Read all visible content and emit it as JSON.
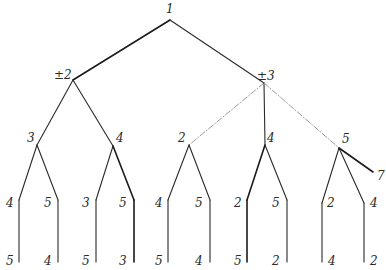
{
  "diagram": {
    "type": "search-tree",
    "nodes": [
      {
        "id": "n1",
        "label": "1",
        "x": 170,
        "y": 20,
        "lx": 166,
        "ly": 13
      },
      {
        "id": "n2",
        "label": "±2",
        "x": 73,
        "y": 80,
        "lx": 54,
        "ly": 79
      },
      {
        "id": "n3",
        "label": "±3",
        "x": 264,
        "y": 83,
        "lx": 257,
        "ly": 80
      },
      {
        "id": "n21",
        "label": "3",
        "x": 37,
        "y": 145,
        "lx": 27,
        "ly": 142
      },
      {
        "id": "n22",
        "label": "4",
        "x": 113,
        "y": 146,
        "lx": 116,
        "ly": 142
      },
      {
        "id": "n31",
        "label": "2",
        "x": 189,
        "y": 145,
        "lx": 178,
        "ly": 142
      },
      {
        "id": "n32",
        "label": "4",
        "x": 265,
        "y": 145,
        "lx": 267,
        "ly": 142
      },
      {
        "id": "n33",
        "label": "5",
        "x": 339,
        "y": 148,
        "lx": 342,
        "ly": 143
      },
      {
        "id": "n211",
        "label": "4",
        "x": 19,
        "y": 200,
        "lx": 6,
        "ly": 207
      },
      {
        "id": "n212",
        "label": "5",
        "x": 58,
        "y": 200,
        "lx": 44,
        "ly": 207
      },
      {
        "id": "n221",
        "label": "3",
        "x": 96,
        "y": 200,
        "lx": 82,
        "ly": 207
      },
      {
        "id": "n222",
        "label": "5",
        "x": 134,
        "y": 200,
        "lx": 119,
        "ly": 207
      },
      {
        "id": "n311",
        "label": "4",
        "x": 168,
        "y": 200,
        "lx": 155,
        "ly": 207
      },
      {
        "id": "n312",
        "label": "5",
        "x": 210,
        "y": 200,
        "lx": 195,
        "ly": 207
      },
      {
        "id": "n321",
        "label": "2",
        "x": 247,
        "y": 200,
        "lx": 234,
        "ly": 207
      },
      {
        "id": "n322",
        "label": "5",
        "x": 287,
        "y": 200,
        "lx": 272,
        "ly": 207
      },
      {
        "id": "n331",
        "label": "2",
        "x": 322,
        "y": 203,
        "lx": 327,
        "ly": 207
      },
      {
        "id": "n332",
        "label": "4",
        "x": 364,
        "y": 203,
        "lx": 370,
        "ly": 207
      },
      {
        "id": "n333",
        "label": "7",
        "x": 373,
        "y": 172,
        "lx": 377,
        "ly": 180
      },
      {
        "id": "n2111",
        "label": "5",
        "x": 19,
        "y": 262,
        "lx": 6,
        "ly": 265
      },
      {
        "id": "n2121",
        "label": "4",
        "x": 58,
        "y": 262,
        "lx": 44,
        "ly": 265
      },
      {
        "id": "n2211",
        "label": "5",
        "x": 96,
        "y": 262,
        "lx": 82,
        "ly": 265
      },
      {
        "id": "n2221",
        "label": "3",
        "x": 134,
        "y": 262,
        "lx": 119,
        "ly": 265
      },
      {
        "id": "n3111",
        "label": "5",
        "x": 168,
        "y": 262,
        "lx": 155,
        "ly": 265
      },
      {
        "id": "n3121",
        "label": "4",
        "x": 210,
        "y": 262,
        "lx": 195,
        "ly": 265
      },
      {
        "id": "n3211",
        "label": "5",
        "x": 247,
        "y": 262,
        "lx": 234,
        "ly": 265
      },
      {
        "id": "n3221",
        "label": "2",
        "x": 287,
        "y": 262,
        "lx": 272,
        "ly": 265
      },
      {
        "id": "n3311",
        "label": "4",
        "x": 322,
        "y": 262,
        "lx": 328,
        "ly": 265
      },
      {
        "id": "n3321",
        "label": "2",
        "x": 364,
        "y": 262,
        "lx": 370,
        "ly": 265
      }
    ],
    "edges": [
      {
        "from": "n1",
        "to": "n2",
        "style": "bold"
      },
      {
        "from": "n1",
        "to": "n3",
        "style": "solid"
      },
      {
        "from": "n2",
        "to": "n21",
        "style": "solid"
      },
      {
        "from": "n2",
        "to": "n22",
        "style": "solid"
      },
      {
        "from": "n3",
        "to": "n31",
        "style": "dashdot"
      },
      {
        "from": "n3",
        "to": "n32",
        "style": "solid"
      },
      {
        "from": "n3",
        "to": "n33",
        "style": "dashdot"
      },
      {
        "from": "n21",
        "to": "n211",
        "style": "solid"
      },
      {
        "from": "n21",
        "to": "n212",
        "style": "solid"
      },
      {
        "from": "n22",
        "to": "n221",
        "style": "solid"
      },
      {
        "from": "n22",
        "to": "n222",
        "style": "bold"
      },
      {
        "from": "n31",
        "to": "n311",
        "style": "solid"
      },
      {
        "from": "n31",
        "to": "n312",
        "style": "solid"
      },
      {
        "from": "n32",
        "to": "n321",
        "style": "bold"
      },
      {
        "from": "n32",
        "to": "n322",
        "style": "solid"
      },
      {
        "from": "n33",
        "to": "n331",
        "style": "solid"
      },
      {
        "from": "n33",
        "to": "n332",
        "style": "solid"
      },
      {
        "from": "n33",
        "to": "n333",
        "style": "bold"
      },
      {
        "from": "n211",
        "to": "n2111",
        "style": "solid"
      },
      {
        "from": "n212",
        "to": "n2121",
        "style": "solid"
      },
      {
        "from": "n221",
        "to": "n2211",
        "style": "solid"
      },
      {
        "from": "n222",
        "to": "n2221",
        "style": "bold"
      },
      {
        "from": "n311",
        "to": "n3111",
        "style": "solid"
      },
      {
        "from": "n312",
        "to": "n3121",
        "style": "solid"
      },
      {
        "from": "n321",
        "to": "n3211",
        "style": "bold"
      },
      {
        "from": "n322",
        "to": "n3221",
        "style": "solid"
      },
      {
        "from": "n331",
        "to": "n3311",
        "style": "solid"
      },
      {
        "from": "n332",
        "to": "n3321",
        "style": "solid"
      }
    ]
  }
}
